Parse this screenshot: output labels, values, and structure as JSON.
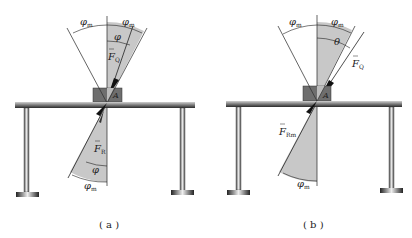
{
  "figure": {
    "panels": [
      {
        "id": "a",
        "caption": "( a )",
        "labels": {
          "phi_m_left": "φ",
          "phi_m_left_sub": "m",
          "phi_m_right": "φ",
          "phi_m_right_sub": "m",
          "phi_top": "φ",
          "force_top": "F",
          "force_top_sub": "Q",
          "point": "A",
          "force_bottom": "F",
          "force_bottom_sub": "R",
          "phi_bottom": "φ",
          "phi_m_bottom": "φ",
          "phi_m_bottom_sub": "m"
        }
      },
      {
        "id": "b",
        "caption": "( b )",
        "labels": {
          "phi_m_left": "φ",
          "phi_m_left_sub": "m",
          "phi_m_right": "φ",
          "phi_m_right_sub": "m",
          "theta": "θ",
          "force_top": "F",
          "force_top_sub": "Q",
          "point": "A",
          "force_bottom": "F",
          "force_bottom_sub": "Rm",
          "phi_m_bottom": "φ",
          "phi_m_bottom_sub": "m"
        }
      }
    ],
    "colors": {
      "sector_fill": "#c8c8c8",
      "line": "#222222",
      "table_top": "#8a8a8a",
      "block": "#6e6e6e",
      "leg": "#9a9a9a"
    }
  }
}
